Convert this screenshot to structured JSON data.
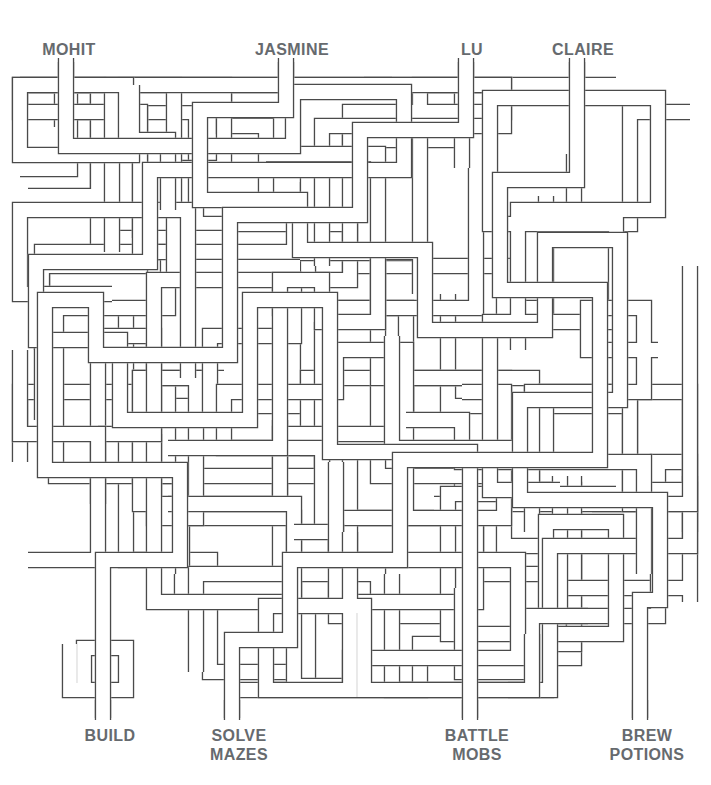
{
  "puzzle": {
    "type": "pipe-maze",
    "title": "",
    "line_color": "#4a4a4a",
    "label_color": "#666a6e",
    "background": "#ffffff",
    "pipe_width": 14,
    "stroke_width": 1.2,
    "width": 711,
    "height": 785
  },
  "top_labels": [
    {
      "id": "mohit",
      "text": "MOHIT",
      "x": 69,
      "pipe_x": 66
    },
    {
      "id": "jasmine",
      "text": "JASMINE",
      "x": 292,
      "pipe_x": 286
    },
    {
      "id": "lu",
      "text": "LU",
      "x": 472,
      "pipe_x": 466
    },
    {
      "id": "claire",
      "text": "CLAIRE",
      "x": 583,
      "pipe_x": 577
    }
  ],
  "bottom_labels": [
    {
      "id": "build",
      "text": "BUILD",
      "x": 110,
      "pipe_x": 103
    },
    {
      "id": "solve-mazes",
      "text": "SOLVE\nMAZES",
      "x": 239,
      "pipe_x": 232
    },
    {
      "id": "battle-mobs",
      "text": "BATTLE\nMOBS",
      "x": 477,
      "pipe_x": 470
    },
    {
      "id": "brew-potions",
      "text": "BREW\nPOTIONS",
      "x": 647,
      "pipe_x": 640
    }
  ],
  "routes": [
    {
      "id": "route-mohit",
      "from": "mohit",
      "to": "battle-mobs",
      "points": [
        [
          66,
          62
        ],
        [
          66,
          146
        ],
        [
          293,
          146
        ],
        [
          293,
          92
        ],
        [
          404,
          92
        ],
        [
          404,
          170
        ],
        [
          150,
          170
        ],
        [
          150,
          262
        ],
        [
          36,
          262
        ],
        [
          36,
          340
        ],
        [
          120,
          340
        ],
        [
          120,
          420
        ],
        [
          250,
          420
        ],
        [
          250,
          300
        ],
        [
          330,
          300
        ],
        [
          330,
          452
        ],
        [
          470,
          452
        ],
        [
          470,
          720
        ]
      ]
    },
    {
      "id": "route-jasmine",
      "from": "jasmine",
      "to": "brew-potions",
      "points": [
        [
          286,
          62
        ],
        [
          286,
          110
        ],
        [
          200,
          110
        ],
        [
          200,
          200
        ],
        [
          300,
          200
        ],
        [
          300,
          250
        ],
        [
          425,
          250
        ],
        [
          425,
          330
        ],
        [
          545,
          330
        ],
        [
          545,
          240
        ],
        [
          620,
          240
        ],
        [
          620,
          400
        ],
        [
          520,
          400
        ],
        [
          520,
          500
        ],
        [
          660,
          500
        ],
        [
          660,
          600
        ],
        [
          640,
          600
        ],
        [
          640,
          720
        ]
      ]
    },
    {
      "id": "route-lu",
      "from": "lu",
      "to": "build",
      "points": [
        [
          466,
          62
        ],
        [
          466,
          130
        ],
        [
          360,
          130
        ],
        [
          360,
          215
        ],
        [
          230,
          215
        ],
        [
          230,
          355
        ],
        [
          96,
          355
        ],
        [
          96,
          300
        ],
        [
          45,
          300
        ],
        [
          45,
          470
        ],
        [
          180,
          470
        ],
        [
          180,
          560
        ],
        [
          103,
          560
        ],
        [
          103,
          720
        ]
      ]
    },
    {
      "id": "route-claire",
      "from": "claire",
      "to": "solve-mazes",
      "points": [
        [
          577,
          62
        ],
        [
          577,
          180
        ],
        [
          500,
          180
        ],
        [
          500,
          290
        ],
        [
          600,
          290
        ],
        [
          600,
          460
        ],
        [
          400,
          460
        ],
        [
          400,
          560
        ],
        [
          290,
          560
        ],
        [
          290,
          640
        ],
        [
          232,
          640
        ],
        [
          232,
          720
        ]
      ]
    }
  ]
}
